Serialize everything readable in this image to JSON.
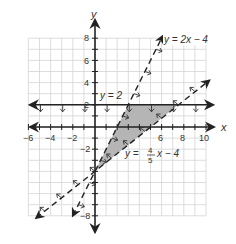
{
  "chart_data": {
    "type": "line",
    "title": "",
    "xlabel": "x",
    "ylabel": "y",
    "xlim": [
      -6,
      10
    ],
    "ylim": [
      -8,
      8
    ],
    "grid": true,
    "x_ticks": [
      -6,
      -4,
      -2,
      6,
      8,
      10
    ],
    "y_ticks": [
      8,
      6,
      4,
      2,
      -2,
      -8
    ],
    "series": [
      {
        "name": "y = 2",
        "equation": "y = 2",
        "style": "solid",
        "shading": "below",
        "slope": 0,
        "intercept": 2
      },
      {
        "name": "y = 2x - 4",
        "equation": "y = 2x − 4",
        "style": "dashed",
        "shading": "right/below",
        "slope": 2,
        "intercept": -4
      },
      {
        "name": "y = 4/5x - 4",
        "equation": "y = (4/5)x − 4",
        "style": "dashed",
        "shading": "left/above",
        "slope": 0.8,
        "intercept": -4
      }
    ],
    "shaded_region": {
      "vertices": [
        [
          0,
          -4
        ],
        [
          3,
          2
        ],
        [
          7.5,
          2
        ]
      ],
      "color": "#b5b5b5"
    },
    "annotations": [
      {
        "text": "y = 2x − 4"
      },
      {
        "text": "y = 2"
      },
      {
        "text": "y = 4/5 x − 4"
      }
    ]
  },
  "labels": {
    "x_axis": "x",
    "y_axis": "y",
    "eq1": "y = 2x − 4",
    "eq2": "y = 2",
    "eq3_left": "y =",
    "eq3_num": "4",
    "eq3_den": "5",
    "eq3_right": "x − 4",
    "tick_x_m6": "−6",
    "tick_x_m4": "−4",
    "tick_x_m2": "−2",
    "tick_x_6": "6",
    "tick_x_8": "8",
    "tick_x_10": "10",
    "tick_y_8": "8",
    "tick_y_6": "6",
    "tick_y_4": "4",
    "tick_y_2": "2",
    "tick_y_m2": "−2",
    "tick_y_m8": "−8"
  },
  "colors": {
    "axis": "#222222",
    "grid": "#d4d4d4",
    "shade": "#b5b5b5",
    "line": "#222222"
  }
}
